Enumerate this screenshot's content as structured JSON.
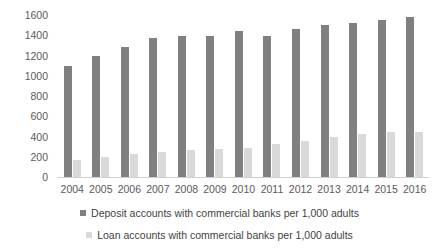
{
  "chart_data": {
    "type": "bar",
    "title": "",
    "subtitle": "",
    "xlabel": "",
    "ylabel": "",
    "ylim": [
      0,
      1600
    ],
    "ytick_step": 200,
    "yticks": [
      "1600",
      "1400",
      "1200",
      "1000",
      "800",
      "600",
      "400",
      "200",
      "0"
    ],
    "grid": false,
    "legend_position": "bottom",
    "categories": [
      "2004",
      "2005",
      "2006",
      "2007",
      "2008",
      "2009",
      "2010",
      "2011",
      "2012",
      "2013",
      "2014",
      "2015",
      "2016"
    ],
    "series": [
      {
        "name": "Deposit accounts with commercial banks per 1,000 adults",
        "key": "deposit",
        "color": "#808080",
        "values": [
          1100,
          1200,
          1285,
          1370,
          1395,
          1395,
          1440,
          1395,
          1465,
          1500,
          1525,
          1550,
          1585
        ]
      },
      {
        "name": "Loan accounts with commercial banks per 1,000 adults",
        "key": "loan",
        "color": "#d9d9d9",
        "values": [
          170,
          200,
          225,
          250,
          265,
          275,
          285,
          325,
          360,
          395,
          425,
          440,
          445
        ]
      }
    ]
  },
  "legend": {
    "items": [
      {
        "label": "Deposit accounts with commercial banks per 1,000 adults",
        "swatch_color": "#808080"
      },
      {
        "label": "Loan accounts with commercial banks per 1,000 adults",
        "swatch_color": "#d9d9d9"
      }
    ]
  },
  "colors": {
    "deposit": "#808080",
    "loan": "#d9d9d9",
    "axis_text": "#5a5a5a",
    "legend_text": "#3f3f3f",
    "background": "#ffffff"
  }
}
